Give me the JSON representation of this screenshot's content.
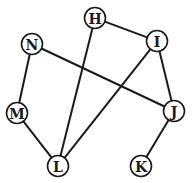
{
  "graph": {
    "nodes": [
      {
        "id": "H",
        "label": "H"
      },
      {
        "id": "I",
        "label": "I"
      },
      {
        "id": "N",
        "label": "N"
      },
      {
        "id": "M",
        "label": "M"
      },
      {
        "id": "J",
        "label": "J"
      },
      {
        "id": "L",
        "label": "L"
      },
      {
        "id": "K",
        "label": "K"
      }
    ],
    "edges": [
      {
        "from": "H",
        "to": "I"
      },
      {
        "from": "H",
        "to": "L"
      },
      {
        "from": "N",
        "to": "M"
      },
      {
        "from": "N",
        "to": "J"
      },
      {
        "from": "M",
        "to": "L"
      },
      {
        "from": "I",
        "to": "L"
      },
      {
        "from": "I",
        "to": "J"
      },
      {
        "from": "J",
        "to": "K"
      }
    ],
    "colors": {
      "stroke": "#1a1a1a",
      "node_fill": "#ffffff"
    }
  }
}
